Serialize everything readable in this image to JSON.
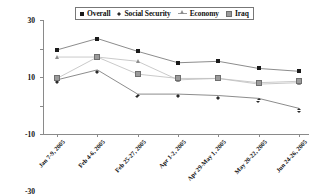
{
  "chart_data": {
    "type": "line",
    "title": "",
    "xlabel": "",
    "ylabel": "",
    "ylim": [
      -50,
      30
    ],
    "yticks": [
      30,
      10,
      -10,
      -30,
      -50
    ],
    "grid": false,
    "legend_position": "top-center",
    "categories": [
      "Jan 7-9, 2005",
      "Feb 4-6, 2005",
      "Feb 25-27, 2005",
      "Apr 1-2, 2005",
      "Apr 29-May 1, 2005",
      "May 20-22, 2005",
      "Jun 24-26, 2005"
    ],
    "series": [
      {
        "name": "Overall",
        "marker": "filled-square",
        "color": "#1a1a1a",
        "values": [
          9,
          17,
          8,
          0,
          1,
          -4,
          -6
        ]
      },
      {
        "name": "Social Security",
        "marker": "filled-diamond",
        "color": "#2a2a2a",
        "values": [
          -12,
          -5,
          -22,
          -22,
          -23,
          -25,
          -32
        ]
      },
      {
        "name": "Economy",
        "marker": "open-triangle",
        "color": "#8d8d8d",
        "values": [
          4,
          4,
          1,
          -12,
          -11,
          -15,
          -14
        ]
      },
      {
        "name": "Iraq",
        "marker": "gray-square",
        "color": "#9b9b9b",
        "values": [
          -11,
          4,
          -8,
          -11,
          -11,
          -14,
          -13
        ]
      }
    ]
  },
  "legend": {
    "items": [
      {
        "label": "Overall",
        "marker": "filled-square"
      },
      {
        "label": "Social Security",
        "marker": "filled-diamond"
      },
      {
        "label": "Economy",
        "marker": "open-triangle"
      },
      {
        "label": "Iraq",
        "marker": "gray-square"
      }
    ]
  }
}
